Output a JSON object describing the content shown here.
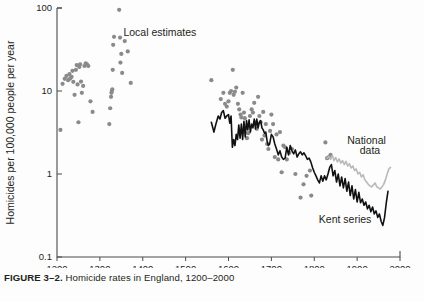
{
  "figure": {
    "caption_label": "FIGURE 3–2.",
    "caption_text": "Homicide rates in England, 1200–2000",
    "background_color": "#fdfdfd"
  },
  "chart_data": {
    "type": "scatter",
    "title": "Homicide rates in England, 1200–2000",
    "xlabel": "",
    "ylabel": "Homicides per 100,000 people per year",
    "xlim": [
      1200,
      2000
    ],
    "ylim": [
      0.1,
      100
    ],
    "yscale": "log",
    "xscale": "linear",
    "grid": false,
    "legend_position": "inline-annotations",
    "xticks": [
      1200,
      1300,
      1400,
      1500,
      1600,
      1700,
      1800,
      1900,
      2000
    ],
    "xtick_labels": [
      "1200",
      "1300",
      "1400",
      "1500",
      "1600",
      "1700",
      "1800",
      "1900",
      "2000"
    ],
    "yticks": [
      0.1,
      1,
      10,
      100
    ],
    "ytick_labels": [
      "0.1",
      "1",
      "10",
      "100"
    ],
    "annotations": [
      {
        "text": "Local estimates",
        "x": 1440,
        "y": 46,
        "name": "local-estimates-label"
      },
      {
        "text": "National",
        "x": 1922,
        "y": 2.3,
        "name": "national-data-label-line1"
      },
      {
        "text": "data",
        "x": 1930,
        "y": 1.75,
        "name": "national-data-label-line2"
      },
      {
        "text": "Kent series",
        "x": 1872,
        "y": 0.26,
        "name": "kent-series-label"
      }
    ],
    "series": [
      {
        "name": "Local estimates",
        "type": "scatter",
        "color": "#8a8a8a",
        "marker": "circle",
        "points": [
          [
            1208,
            3.4
          ],
          [
            1213,
            12.2
          ],
          [
            1218,
            14.0
          ],
          [
            1222,
            15.2
          ],
          [
            1226,
            13.5
          ],
          [
            1229,
            16.0
          ],
          [
            1231,
            14.2
          ],
          [
            1234,
            14.8
          ],
          [
            1236,
            17.5
          ],
          [
            1238,
            12.9
          ],
          [
            1241,
            9.0
          ],
          [
            1244,
            18.0
          ],
          [
            1246,
            20.5
          ],
          [
            1248,
            12.0
          ],
          [
            1250,
            4.2
          ],
          [
            1252,
            19.5
          ],
          [
            1254,
            21.0
          ],
          [
            1256,
            13.0
          ],
          [
            1258,
            9.5
          ],
          [
            1261,
            11.5
          ],
          [
            1264,
            20.0
          ],
          [
            1267,
            21.5
          ],
          [
            1270,
            21.0
          ],
          [
            1273,
            20.0
          ],
          [
            1278,
            7.5
          ],
          [
            1283,
            5.6
          ],
          [
            1322,
            4.0
          ],
          [
            1324,
            6.2
          ],
          [
            1326,
            8.5
          ],
          [
            1327,
            9.5
          ],
          [
            1328,
            10.0
          ],
          [
            1329,
            10.5
          ],
          [
            1330,
            18.0
          ],
          [
            1331,
            36.0
          ],
          [
            1333,
            45.0
          ],
          [
            1345,
            95.0
          ],
          [
            1347,
            44.0
          ],
          [
            1348,
            22.0
          ],
          [
            1350,
            28.0
          ],
          [
            1352,
            16.5
          ],
          [
            1358,
            40.0
          ],
          [
            1365,
            30.0
          ],
          [
            1372,
            12.5
          ],
          [
            1560,
            13.5
          ],
          [
            1582,
            8.0
          ],
          [
            1588,
            9.5
          ],
          [
            1592,
            7.0
          ],
          [
            1596,
            6.5
          ],
          [
            1600,
            7.5
          ],
          [
            1603,
            9.5
          ],
          [
            1606,
            10.0
          ],
          [
            1610,
            18.0
          ],
          [
            1612,
            9.0
          ],
          [
            1615,
            9.8
          ],
          [
            1618,
            11.0
          ],
          [
            1622,
            7.0
          ],
          [
            1625,
            6.0
          ],
          [
            1628,
            5.2
          ],
          [
            1630,
            4.8
          ],
          [
            1633,
            9.5
          ],
          [
            1636,
            5.5
          ],
          [
            1638,
            4.7
          ],
          [
            1640,
            3.6
          ],
          [
            1643,
            2.7
          ],
          [
            1646,
            3.1
          ],
          [
            1650,
            5.0
          ],
          [
            1654,
            6.0
          ],
          [
            1657,
            5.5
          ],
          [
            1660,
            7.2
          ],
          [
            1663,
            4.2
          ],
          [
            1666,
            3.5
          ],
          [
            1669,
            8.5
          ],
          [
            1672,
            5.0
          ],
          [
            1675,
            4.2
          ],
          [
            1678,
            2.6
          ],
          [
            1681,
            5.6
          ],
          [
            1684,
            2.9
          ],
          [
            1687,
            4.0
          ],
          [
            1690,
            2.3
          ],
          [
            1693,
            2.0
          ],
          [
            1697,
            3.3
          ],
          [
            1700,
            5.2
          ],
          [
            1704,
            4.0
          ],
          [
            1708,
            1.6
          ],
          [
            1712,
            3.0
          ],
          [
            1716,
            1.5
          ],
          [
            1720,
            3.2
          ],
          [
            1724,
            1.05
          ],
          [
            1728,
            2.2
          ],
          [
            1732,
            2.1
          ],
          [
            1736,
            1.5
          ],
          [
            1742,
            1.8
          ],
          [
            1748,
            2.0
          ],
          [
            1756,
            1.0
          ],
          [
            1768,
            0.52
          ],
          [
            1775,
            0.75
          ],
          [
            1782,
            0.95
          ],
          [
            1790,
            1.1
          ],
          [
            1793,
            0.55
          ],
          [
            1826,
            2.4
          ],
          [
            1830,
            1.55
          ],
          [
            1834,
            1.6
          ],
          [
            1838,
            1.7
          ]
        ]
      },
      {
        "name": "Kent series",
        "type": "line",
        "color": "#111111",
        "line_width": 1.6,
        "points": [
          [
            1560,
            4.2
          ],
          [
            1566,
            3.2
          ],
          [
            1570,
            3.9
          ],
          [
            1576,
            5.0
          ],
          [
            1580,
            4.6
          ],
          [
            1584,
            5.5
          ],
          [
            1588,
            5.8
          ],
          [
            1592,
            4.7
          ],
          [
            1596,
            5.0
          ],
          [
            1600,
            5.2
          ],
          [
            1603,
            4.1
          ],
          [
            1606,
            5.0
          ],
          [
            1609,
            2.1
          ],
          [
            1612,
            2.6
          ],
          [
            1615,
            2.2
          ],
          [
            1618,
            3.0
          ],
          [
            1621,
            2.6
          ],
          [
            1624,
            3.9
          ],
          [
            1627,
            2.7
          ],
          [
            1630,
            4.0
          ],
          [
            1633,
            2.6
          ],
          [
            1636,
            4.3
          ],
          [
            1639,
            2.8
          ],
          [
            1642,
            4.4
          ],
          [
            1645,
            3.4
          ],
          [
            1648,
            4.5
          ],
          [
            1651,
            3.2
          ],
          [
            1654,
            4.0
          ],
          [
            1657,
            3.6
          ],
          [
            1660,
            4.6
          ],
          [
            1663,
            3.5
          ],
          [
            1666,
            4.6
          ],
          [
            1669,
            3.6
          ],
          [
            1672,
            4.2
          ],
          [
            1675,
            4.4
          ],
          [
            1678,
            3.6
          ],
          [
            1681,
            3.4
          ],
          [
            1684,
            3.1
          ],
          [
            1687,
            3.2
          ],
          [
            1690,
            2.5
          ],
          [
            1693,
            2.2
          ],
          [
            1696,
            2.3
          ],
          [
            1700,
            3.0
          ],
          [
            1704,
            2.8
          ],
          [
            1708,
            2.3
          ],
          [
            1712,
            2.0
          ],
          [
            1716,
            1.7
          ],
          [
            1720,
            1.9
          ],
          [
            1724,
            1.6
          ],
          [
            1728,
            1.5
          ],
          [
            1732,
            1.55
          ],
          [
            1736,
            2.1
          ],
          [
            1740,
            1.7
          ],
          [
            1744,
            2.2
          ],
          [
            1748,
            1.9
          ],
          [
            1752,
            1.75
          ],
          [
            1756,
            1.95
          ],
          [
            1760,
            1.6
          ],
          [
            1764,
            1.75
          ],
          [
            1768,
            1.85
          ],
          [
            1772,
            1.7
          ],
          [
            1776,
            1.8
          ],
          [
            1780,
            1.65
          ],
          [
            1784,
            1.5
          ],
          [
            1788,
            1.55
          ],
          [
            1792,
            1.4
          ],
          [
            1796,
            1.2
          ],
          [
            1800,
            1.05
          ],
          [
            1804,
            0.95
          ],
          [
            1808,
            0.85
          ],
          [
            1812,
            0.78
          ],
          [
            1816,
            0.95
          ],
          [
            1820,
            0.82
          ],
          [
            1824,
            0.95
          ],
          [
            1828,
            0.85
          ],
          [
            1832,
            1.0
          ],
          [
            1836,
            1.2
          ],
          [
            1840,
            1.3
          ],
          [
            1844,
            0.95
          ],
          [
            1848,
            1.1
          ],
          [
            1852,
            0.8
          ],
          [
            1856,
            1.0
          ],
          [
            1860,
            0.72
          ],
          [
            1864,
            0.92
          ],
          [
            1868,
            0.68
          ],
          [
            1872,
            0.88
          ],
          [
            1876,
            0.62
          ],
          [
            1880,
            0.8
          ],
          [
            1884,
            0.55
          ],
          [
            1888,
            0.72
          ],
          [
            1892,
            0.5
          ],
          [
            1896,
            0.65
          ],
          [
            1900,
            0.46
          ],
          [
            1904,
            0.6
          ],
          [
            1908,
            0.45
          ],
          [
            1912,
            0.5
          ],
          [
            1916,
            0.42
          ],
          [
            1920,
            0.46
          ],
          [
            1924,
            0.38
          ],
          [
            1928,
            0.42
          ],
          [
            1932,
            0.35
          ],
          [
            1936,
            0.4
          ],
          [
            1940,
            0.33
          ],
          [
            1944,
            0.36
          ],
          [
            1948,
            0.3
          ],
          [
            1952,
            0.33
          ],
          [
            1956,
            0.27
          ],
          [
            1960,
            0.24
          ],
          [
            1964,
            0.3
          ],
          [
            1968,
            0.45
          ],
          [
            1972,
            0.62
          ]
        ]
      },
      {
        "name": "National data",
        "type": "line",
        "color": "#b9b9b9",
        "line_width": 1.6,
        "points": [
          [
            1830,
            1.55
          ],
          [
            1834,
            1.62
          ],
          [
            1838,
            1.5
          ],
          [
            1842,
            1.68
          ],
          [
            1846,
            1.45
          ],
          [
            1850,
            1.58
          ],
          [
            1854,
            1.4
          ],
          [
            1858,
            1.52
          ],
          [
            1862,
            1.35
          ],
          [
            1866,
            1.45
          ],
          [
            1870,
            1.3
          ],
          [
            1874,
            1.42
          ],
          [
            1878,
            1.25
          ],
          [
            1882,
            1.33
          ],
          [
            1886,
            1.18
          ],
          [
            1890,
            1.25
          ],
          [
            1894,
            1.1
          ],
          [
            1898,
            1.15
          ],
          [
            1902,
            1.0
          ],
          [
            1906,
            1.05
          ],
          [
            1910,
            0.92
          ],
          [
            1914,
            0.98
          ],
          [
            1918,
            0.85
          ],
          [
            1922,
            0.8
          ],
          [
            1926,
            0.75
          ],
          [
            1930,
            0.72
          ],
          [
            1934,
            0.7
          ],
          [
            1938,
            0.74
          ],
          [
            1942,
            0.78
          ],
          [
            1946,
            0.7
          ],
          [
            1950,
            0.68
          ],
          [
            1954,
            0.66
          ],
          [
            1958,
            0.7
          ],
          [
            1962,
            0.75
          ],
          [
            1966,
            0.85
          ],
          [
            1970,
            1.0
          ],
          [
            1974,
            1.15
          ],
          [
            1978,
            1.2
          ]
        ]
      }
    ]
  }
}
